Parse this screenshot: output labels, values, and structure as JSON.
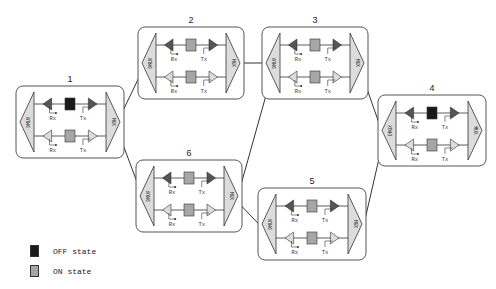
{
  "diagram": {
    "type": "optical-network-topology",
    "nodes": [
      {
        "id": "1",
        "label": "1",
        "x": 16,
        "y": 86,
        "w": 108,
        "h": 72,
        "top_switch": "OFF",
        "bottom_switch": "ON",
        "demux_label": "DMUX",
        "mux_label": "MUX",
        "top_rx": "Rx",
        "top_tx": "Tx",
        "bottom_rx": "Rx",
        "bottom_tx": "Tx"
      },
      {
        "id": "2",
        "label": "2",
        "x": 138,
        "y": 27,
        "w": 106,
        "h": 72,
        "top_switch": "ON",
        "bottom_switch": "ON",
        "demux_label": "DMUX",
        "mux_label": "MUX",
        "top_rx": "Rx",
        "top_tx": "Tx",
        "bottom_rx": "Rx",
        "bottom_tx": "Tx"
      },
      {
        "id": "3",
        "label": "3",
        "x": 262,
        "y": 27,
        "w": 106,
        "h": 72,
        "top_switch": "ON",
        "bottom_switch": "ON",
        "demux_label": "DMUX",
        "mux_label": "MUX",
        "top_rx": "Rx",
        "top_tx": "Tx",
        "bottom_rx": "Rx",
        "bottom_tx": "Tx"
      },
      {
        "id": "4",
        "label": "4",
        "x": 378,
        "y": 95,
        "w": 108,
        "h": 71,
        "top_switch": "OFF",
        "bottom_switch": "ON",
        "demux_label": "DMUX",
        "mux_label": "MUX",
        "top_rx": "Rx",
        "top_tx": "Tx",
        "bottom_rx": "Rx",
        "bottom_tx": "Tx"
      },
      {
        "id": "5",
        "label": "5",
        "x": 258,
        "y": 188,
        "w": 108,
        "h": 72,
        "top_switch": "ON",
        "bottom_switch": "ON",
        "demux_label": "DMUX",
        "mux_label": "MUX",
        "top_rx": "Rx",
        "top_tx": "Tx",
        "bottom_rx": "Rx",
        "bottom_tx": "Tx"
      },
      {
        "id": "6",
        "label": "6",
        "x": 136,
        "y": 160,
        "w": 106,
        "h": 72,
        "top_switch": "ON",
        "bottom_switch": "ON",
        "demux_label": "DMUX",
        "mux_label": "MUX",
        "top_rx": "Rx",
        "top_tx": "Tx",
        "bottom_rx": "Rx",
        "bottom_tx": "Tx"
      }
    ],
    "links": [
      {
        "from": "1",
        "to": "2",
        "x1": 104,
        "y1": 150,
        "x2": 158,
        "y2": 38
      },
      {
        "from": "1",
        "to": "6",
        "x1": 104,
        "y1": 94,
        "x2": 152,
        "y2": 222
      },
      {
        "from": "2",
        "to": "3",
        "x1": 240,
        "y1": 63,
        "x2": 272,
        "y2": 63
      },
      {
        "from": "6",
        "to": "3",
        "x1": 230,
        "y1": 224,
        "x2": 282,
        "y2": 38
      },
      {
        "from": "6",
        "to": "5",
        "x1": 232,
        "y1": 196,
        "x2": 272,
        "y2": 238
      },
      {
        "from": "3",
        "to": "4",
        "x1": 348,
        "y1": 35,
        "x2": 392,
        "y2": 160
      },
      {
        "from": "5",
        "to": "4",
        "x1": 358,
        "y1": 250,
        "x2": 392,
        "y2": 102
      }
    ]
  },
  "legend": {
    "items": [
      {
        "label": "OFF state",
        "color": "#1a1a1a"
      },
      {
        "label": "ON state",
        "color": "#a6a6a6"
      }
    ]
  },
  "colors": {
    "off": "#1a1a1a",
    "on": "#a6a6a6",
    "on_light": "#e6e6e6",
    "box_border": "#555555",
    "line": "#333333",
    "amp_dark": "#555555",
    "amp_light": "#dcdcdc"
  }
}
